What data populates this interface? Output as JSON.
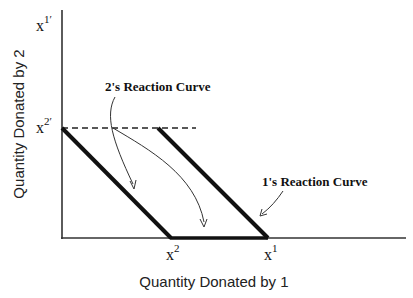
{
  "diagram": {
    "type": "reaction-curves",
    "x_axis_label": "Quantity Donated by 1",
    "y_axis_label": "Quantity Donated by 2",
    "y_ticks": [
      {
        "base": "x",
        "sup": "1′",
        "position": "top"
      },
      {
        "base": "x",
        "sup": "2′",
        "position": "middle"
      }
    ],
    "x_ticks": [
      {
        "base": "x",
        "sup": "2"
      },
      {
        "base": "x",
        "sup": "1"
      }
    ],
    "curves": [
      {
        "name": "2's Reaction Curve",
        "label": "2's Reaction Curve",
        "from": "x2′ on y-axis",
        "to": "x2 on x-axis"
      },
      {
        "name": "1's Reaction Curve",
        "label": "1's Reaction Curve",
        "from": "x2′ height",
        "to": "x1 on x-axis"
      }
    ],
    "reference_line": {
      "style": "dashed",
      "at": "x2′"
    },
    "colors": {
      "axis": "#222222",
      "curve": "#111111",
      "arrow": "#333333",
      "background": "#ffffff"
    }
  }
}
